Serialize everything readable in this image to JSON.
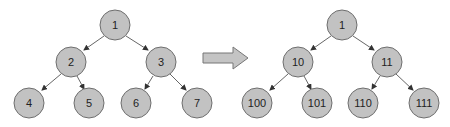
{
  "diagram": {
    "type": "binary-tree-relabeling",
    "node_fill": "#c2c2c2",
    "node_stroke": "#6e6e6e",
    "arrow_fill": "#c4c4c4",
    "left_tree": {
      "root": "1",
      "level1": [
        "2",
        "3"
      ],
      "level2": [
        "4",
        "5",
        "6",
        "7"
      ]
    },
    "transform_arrow": "right-arrow",
    "right_tree": {
      "root": "1",
      "level1": [
        "10",
        "11"
      ],
      "level2": [
        "100",
        "101",
        "110",
        "111"
      ]
    }
  }
}
